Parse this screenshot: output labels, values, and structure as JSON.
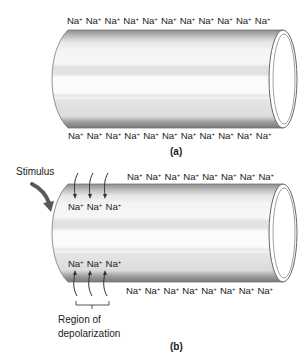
{
  "panel_a": {
    "caption": "(a)",
    "ion": "Na",
    "ion_charge": "+",
    "top_row_count": 11,
    "bottom_row_count": 11
  },
  "panel_b": {
    "caption": "(b)",
    "stimulus_label": "Stimulus",
    "ion": "Na",
    "ion_charge": "+",
    "top_row_count": 8,
    "bottom_row_count": 8,
    "inner_top_count": 3,
    "inner_bottom_count": 3,
    "region_label_line1": "Region of",
    "region_label_line2": "depolarization"
  },
  "colors": {
    "cylinder_body": "#f2f2f2",
    "cylinder_band": "#e0e0e0",
    "cylinder_edge": "#8a8a8a",
    "text": "#1a1a1a",
    "stimulus_arrow": "#5a5a5a"
  }
}
